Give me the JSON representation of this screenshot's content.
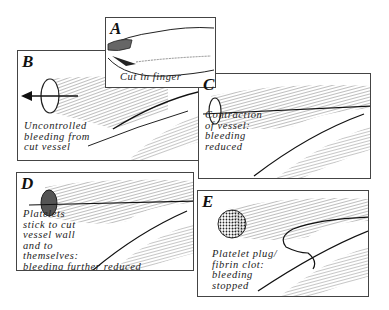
{
  "figure": {
    "panels": [
      {
        "id": "A",
        "letter": "A",
        "caption": [
          "Cut in finger"
        ]
      },
      {
        "id": "B",
        "letter": "B",
        "caption": [
          "Uncontrolled",
          "bleeding from",
          "cut vessel"
        ]
      },
      {
        "id": "C",
        "letter": "C",
        "caption": [
          "Contraction",
          "of vessel:",
          "bleeding",
          "reduced"
        ]
      },
      {
        "id": "D",
        "letter": "D",
        "caption": [
          "Platelets",
          "stick to cut",
          "vessel wall",
          "and to",
          "themselves:",
          "bleeding further reduced"
        ]
      },
      {
        "id": "E",
        "letter": "E",
        "caption": [
          "Platelet plug/",
          "fibrin clot:",
          "bleeding",
          "stopped"
        ]
      }
    ],
    "colors": {
      "ink": "#222222",
      "border": "#444444",
      "background": "#ffffff"
    }
  }
}
